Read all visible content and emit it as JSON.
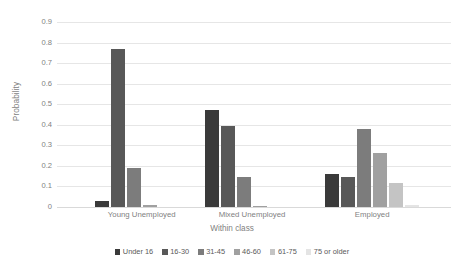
{
  "chart_data": {
    "type": "bar",
    "title": "",
    "subtitle": "",
    "xlabel": "Within class",
    "ylabel": "Probability",
    "ylim": [
      0,
      0.9
    ],
    "grid": true,
    "legend_position": "bottom",
    "categories": [
      "Young Unemployed",
      "Mixed Unemployed",
      "Employed"
    ],
    "ytick_labels": [
      "0.9",
      "0.8",
      "0.7",
      "0.6",
      "0.5",
      "0.4",
      "0.3",
      "0.2",
      "0.1",
      "0"
    ],
    "ytick_values": [
      0.9,
      0.8,
      0.7,
      0.6,
      0.5,
      0.4,
      0.3,
      0.2,
      0.1,
      0
    ],
    "series": [
      {
        "name": "Under 16",
        "color": "#3a3a3a",
        "values": [
          0.03,
          0.47,
          0.16
        ]
      },
      {
        "name": "16-30",
        "color": "#585858",
        "values": [
          0.77,
          0.395,
          0.145
        ]
      },
      {
        "name": "31-45",
        "color": "#7c7c7c",
        "values": [
          0.19,
          0.145,
          0.38
        ]
      },
      {
        "name": "46-60",
        "color": "#a0a0a0",
        "values": [
          0.01,
          0.005,
          0.265
        ]
      },
      {
        "name": "61-75",
        "color": "#c4c4c4",
        "values": [
          0.0,
          0.0,
          0.115
        ]
      },
      {
        "name": "75 or older",
        "color": "#e4e4e4",
        "values": [
          0.0,
          0.0,
          0.01
        ]
      }
    ]
  },
  "colors": {
    "gridline": "#e6e6e6",
    "axis_text": "#7f7f7f",
    "legend_text": "#595959",
    "background": "#ffffff"
  }
}
